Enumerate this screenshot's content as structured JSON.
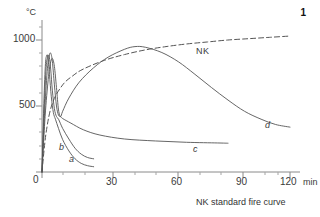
{
  "figure": {
    "number": "1",
    "caption": "NK standard fire curve"
  },
  "axes": {
    "y_unit": "°C",
    "x_unit": "min",
    "y_ticks": [
      "0",
      "500",
      "1000"
    ],
    "x_ticks": [
      "0",
      "30",
      "60",
      "90",
      "120"
    ]
  },
  "series_labels": {
    "nk": "NK",
    "a": "a",
    "b": "b",
    "c": "c",
    "d": "d"
  },
  "chart_data": {
    "type": "line",
    "title": "NK standard fire curve",
    "xlabel": "min",
    "ylabel": "°C",
    "xlim": [
      0,
      120
    ],
    "ylim": [
      0,
      1100
    ],
    "xticks": [
      0,
      30,
      60,
      90,
      120
    ],
    "yticks": [
      0,
      500,
      1000
    ],
    "xminor_step": 10,
    "yminor_step": 100,
    "grid": false,
    "legend": "inline-labels",
    "series": [
      {
        "name": "NK",
        "style": "dashed",
        "points": [
          [
            0,
            0
          ],
          [
            2,
            300
          ],
          [
            5,
            520
          ],
          [
            10,
            660
          ],
          [
            15,
            730
          ],
          [
            20,
            780
          ],
          [
            30,
            845
          ],
          [
            40,
            890
          ],
          [
            50,
            925
          ],
          [
            60,
            950
          ],
          [
            70,
            970
          ],
          [
            80,
            985
          ],
          [
            90,
            1000
          ],
          [
            100,
            1010
          ],
          [
            110,
            1020
          ],
          [
            120,
            1030
          ]
        ]
      },
      {
        "name": "d",
        "style": "solid",
        "points": [
          [
            0,
            0
          ],
          [
            1.5,
            420
          ],
          [
            3,
            700
          ],
          [
            4,
            820
          ],
          [
            5,
            860
          ],
          [
            6,
            800
          ],
          [
            7,
            640
          ],
          [
            8,
            470
          ],
          [
            9,
            420
          ],
          [
            10,
            460
          ],
          [
            13,
            560
          ],
          [
            18,
            680
          ],
          [
            25,
            790
          ],
          [
            32,
            870
          ],
          [
            40,
            930
          ],
          [
            45,
            950
          ],
          [
            50,
            945
          ],
          [
            58,
            905
          ],
          [
            66,
            835
          ],
          [
            74,
            740
          ],
          [
            82,
            640
          ],
          [
            90,
            545
          ],
          [
            98,
            460
          ],
          [
            106,
            400
          ],
          [
            113,
            360
          ],
          [
            120,
            340
          ]
        ]
      },
      {
        "name": "c",
        "style": "solid",
        "points": [
          [
            0,
            0
          ],
          [
            1.2,
            430
          ],
          [
            2.5,
            760
          ],
          [
            3.5,
            880
          ],
          [
            4.2,
            900
          ],
          [
            5,
            840
          ],
          [
            6,
            660
          ],
          [
            7,
            500
          ],
          [
            8,
            430
          ],
          [
            9,
            420
          ],
          [
            10,
            405
          ],
          [
            14,
            370
          ],
          [
            20,
            320
          ],
          [
            28,
            280
          ],
          [
            40,
            250
          ],
          [
            55,
            235
          ],
          [
            70,
            225
          ],
          [
            85,
            220
          ],
          [
            90,
            218
          ]
        ]
      },
      {
        "name": "b",
        "style": "solid",
        "points": [
          [
            0,
            0
          ],
          [
            1,
            460
          ],
          [
            2,
            790
          ],
          [
            2.8,
            870
          ],
          [
            3.4,
            880
          ],
          [
            4.2,
            780
          ],
          [
            5,
            620
          ],
          [
            6,
            480
          ],
          [
            7,
            420
          ],
          [
            8,
            400
          ],
          [
            10,
            330
          ],
          [
            13,
            250
          ],
          [
            16,
            180
          ],
          [
            19,
            135
          ],
          [
            22,
            110
          ],
          [
            25,
            100
          ]
        ]
      },
      {
        "name": "a",
        "style": "solid",
        "points": [
          [
            0,
            0
          ],
          [
            0.8,
            470
          ],
          [
            1.6,
            800
          ],
          [
            2.2,
            880
          ],
          [
            2.8,
            870
          ],
          [
            3.6,
            740
          ],
          [
            4.5,
            570
          ],
          [
            5.5,
            450
          ],
          [
            6.5,
            400
          ],
          [
            8,
            330
          ],
          [
            10,
            245
          ],
          [
            13,
            160
          ],
          [
            16,
            100
          ],
          [
            19,
            65
          ],
          [
            22,
            48
          ],
          [
            25,
            40
          ]
        ]
      }
    ]
  }
}
